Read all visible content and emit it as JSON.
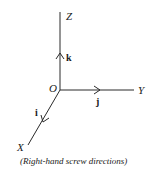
{
  "diagram": {
    "axes": {
      "z_label": "Z",
      "y_label": "Y",
      "x_label": "X",
      "origin_label": "O"
    },
    "unit_vectors": {
      "k": "k",
      "j": "j",
      "i": "i"
    },
    "caption": "(Right-hand screw directions)",
    "colors": {
      "line": "#2a2a2a",
      "text": "#1a1a1a",
      "background": "#ffffff"
    }
  }
}
